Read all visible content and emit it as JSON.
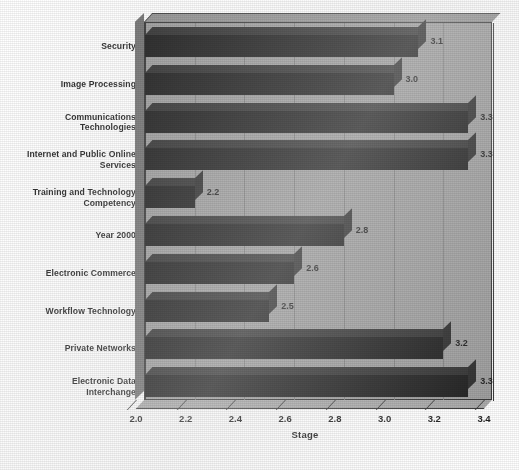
{
  "chart_data": {
    "type": "bar",
    "orientation": "horizontal",
    "title": "",
    "xlabel": "Stage",
    "ylabel": "",
    "xlim": [
      2.0,
      3.4
    ],
    "xticks": [
      "2.0",
      "2.2",
      "2.4",
      "2.6",
      "2.8",
      "3.0",
      "3.2",
      "3.4"
    ],
    "grid": true,
    "legend": false,
    "style": "3d-bar",
    "categories": [
      "Security",
      "Image Processing",
      "Communications\nTechnologies",
      "Internet and Public Online\nServices",
      "Training and Technology\nCompetency",
      "Year 2000",
      "Electronic Commerce",
      "Workflow  Technology",
      "Private Networks",
      "Electronic Data\nInterchange"
    ],
    "values": [
      3.1,
      3.0,
      3.3,
      3.3,
      2.2,
      2.8,
      2.6,
      2.5,
      3.2,
      3.3
    ],
    "data_labels": [
      "3.1",
      "3.0",
      "3.3",
      "3.3",
      "2.2",
      "2.8",
      "2.6",
      "2.5",
      "3.2",
      "3.3"
    ],
    "colors": {
      "bar": "#151515",
      "bar_top": "#2a2a2a",
      "bar_cap": "#242424",
      "plot_background": "#9a9a9a",
      "plot_top_face": "#8f8f8f",
      "plot_left_face": "#6e6e6e",
      "plot_floor": "#a6a6a6",
      "gridline": "#7c7c7c",
      "axis": "#2e2e2e",
      "text": "#141414",
      "page_background": "#ffffff"
    }
  }
}
